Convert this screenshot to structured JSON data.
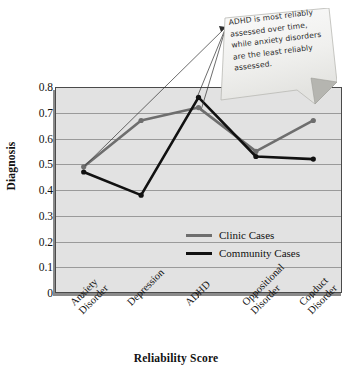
{
  "chart_data": {
    "type": "line",
    "title": "",
    "xlabel": "Reliability Score",
    "ylabel": "Diagnosis",
    "categories": [
      "Anxiety Disorder",
      "Depression",
      "ADHD",
      "Oppositional Disorder",
      "Conduct Disorder"
    ],
    "category_lines": [
      [
        "Anxiety",
        "Disorder"
      ],
      [
        "Depression"
      ],
      [
        "ADHD"
      ],
      [
        "Oppositional",
        "Disorder"
      ],
      [
        "Conduct",
        "Disorder"
      ]
    ],
    "series": [
      {
        "name": "Clinic Cases",
        "color": "#6e6e6e",
        "values": [
          0.49,
          0.67,
          0.72,
          0.55,
          0.67
        ]
      },
      {
        "name": "Community Cases",
        "color": "#111111",
        "values": [
          0.47,
          0.38,
          0.76,
          0.53,
          0.52
        ]
      }
    ],
    "ylim": [
      0,
      0.8
    ],
    "ytick_labels": [
      "0.8",
      "0.7",
      "0.6",
      "0.5",
      "0.4",
      "0.3",
      "0.2",
      "0.1",
      "0"
    ],
    "ytick_values": [
      0.8,
      0.7,
      0.6,
      0.5,
      0.4,
      0.3,
      0.2,
      0.1,
      0
    ],
    "grid": true,
    "legend_position": "inside-center-right",
    "plot_background": "#e2e2e2",
    "annotations": [
      {
        "text": "ADHD is most reliably assessed over time, while anxiety disorders are the least reliably assessed.",
        "style": "sticky-note",
        "points_to": [
          "Anxiety Disorder",
          "ADHD"
        ]
      }
    ]
  }
}
